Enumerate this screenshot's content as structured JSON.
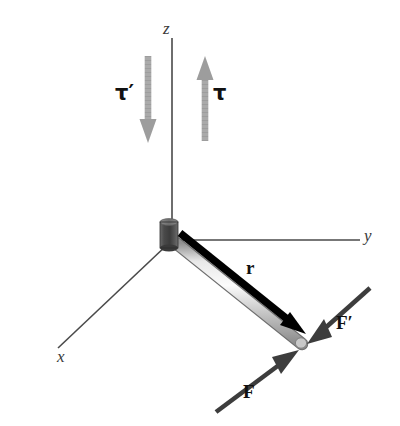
{
  "figure": {
    "background_color": "#ffffff",
    "width": 400,
    "height": 426
  },
  "axes": {
    "z": {
      "label": "z",
      "name": "z-axis",
      "color": "#4a4a4a"
    },
    "y": {
      "label": "y",
      "name": "y-axis",
      "color": "#4a4a4a"
    },
    "x": {
      "label": "x",
      "name": "x-axis",
      "color": "#4a4a4a"
    }
  },
  "origin": {
    "label": "",
    "name": "pivot-cylinder",
    "color": "#4d4d4d"
  },
  "rod": {
    "label": "",
    "name": "rod",
    "color": "#c9c9c9"
  },
  "vectors": {
    "r": {
      "label": "r",
      "name": "position-vector-r",
      "color": "#000000"
    },
    "F": {
      "label": "F",
      "name": "force-vector-F",
      "color": "#3d3d3d"
    },
    "F_prime": {
      "label": "F′",
      "name": "force-vector-F-prime",
      "color": "#3d3d3d"
    },
    "tau": {
      "label": "τ",
      "name": "torque-vector-tau",
      "color": "#a8a8a8"
    },
    "tau_prime": {
      "label": "τ′",
      "name": "torque-vector-tau-prime",
      "color": "#a8a8a8"
    }
  },
  "colors": {
    "black": "#000000",
    "dark_gray": "#3d3d3d",
    "mid_gray": "#4d4d4d",
    "light_gray": "#a8a8a8",
    "rod_gray": "#c9c9c9",
    "axis_gray": "#4a4a4a",
    "background": "#ffffff"
  }
}
